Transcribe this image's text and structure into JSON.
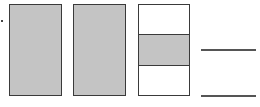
{
  "diagram": {
    "type": "fraction-model",
    "colors": {
      "shaded": "#c4c4c4",
      "outline": "#3a3a3a",
      "background": "#ffffff"
    },
    "wholes": [
      {
        "parts": 1,
        "shaded_parts": [
          0
        ]
      },
      {
        "parts": 1,
        "shaded_parts": [
          0
        ]
      },
      {
        "parts": 3,
        "shaded_parts": [
          1
        ]
      }
    ],
    "answer": {
      "numerator": "",
      "denominator": ""
    }
  }
}
